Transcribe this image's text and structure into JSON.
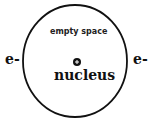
{
  "diagram": {
    "type": "atom-model",
    "region_label": "empty space",
    "center_label": "nucleus",
    "nucleus_symbol": "+",
    "electrons": [
      {
        "label": "e-",
        "position": "left"
      },
      {
        "label": "e-",
        "position": "right"
      }
    ],
    "colors": {
      "stroke": "#111111",
      "background": "#ffffff"
    }
  }
}
